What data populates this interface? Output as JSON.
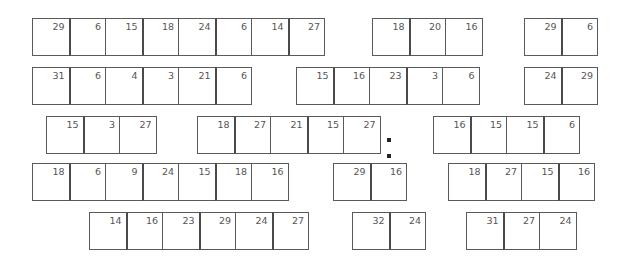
{
  "rows": [
    {
      "top": 18,
      "groups": [
        {
          "left": 32,
          "values": [
            29,
            6,
            15,
            18,
            24,
            6,
            14,
            27
          ]
        },
        {
          "left": 372,
          "values": [
            18,
            20,
            16
          ]
        },
        {
          "left": 524,
          "values": [
            29,
            6
          ]
        }
      ]
    },
    {
      "top": 67,
      "groups": [
        {
          "left": 32,
          "values": [
            31,
            6,
            4,
            3,
            21,
            6
          ]
        },
        {
          "left": 296,
          "values": [
            15,
            16,
            23,
            3,
            6
          ]
        },
        {
          "left": 524,
          "values": [
            24,
            29
          ]
        }
      ]
    },
    {
      "top": 116,
      "groups": [
        {
          "left": 46,
          "values": [
            15,
            3,
            27
          ]
        },
        {
          "left": 197,
          "values": [
            18,
            27,
            21,
            15,
            27
          ]
        },
        {
          "left": 433,
          "values": [
            16,
            15,
            15,
            6
          ]
        }
      ]
    },
    {
      "top": 163,
      "groups": [
        {
          "left": 32,
          "values": [
            18,
            6,
            9,
            24,
            15,
            18,
            16
          ]
        },
        {
          "left": 333,
          "values": [
            29,
            16
          ]
        },
        {
          "left": 448,
          "values": [
            18,
            27,
            15,
            16
          ]
        }
      ]
    },
    {
      "top": 212,
      "groups": [
        {
          "left": 89,
          "values": [
            14,
            16,
            23,
            29,
            24,
            27
          ]
        },
        {
          "left": 352,
          "values": [
            32,
            24
          ]
        },
        {
          "left": 466,
          "values": [
            31,
            27,
            24
          ]
        }
      ]
    }
  ],
  "dots": [
    {
      "left": 387,
      "top": 138
    },
    {
      "left": 387,
      "top": 154
    }
  ]
}
